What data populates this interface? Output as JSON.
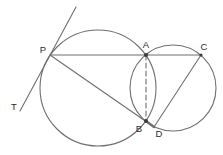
{
  "figure": {
    "width": 223,
    "height": 155,
    "background": "#ffffff",
    "stroke_color": "#6f6f6f",
    "dot_color": "#3c3c3c",
    "label_color": "#2b2b2b",
    "circles": [
      {
        "name": "large-circle",
        "cx": 98,
        "cy": 88,
        "r": 58
      },
      {
        "name": "small-circle",
        "cx": 173,
        "cy": 88,
        "r": 43
      }
    ],
    "lines": [
      {
        "name": "tangent-line-through-P",
        "x1": 76,
        "y1": 7,
        "x2": 20,
        "y2": 111,
        "dashed": false,
        "width": 1.1
      },
      {
        "name": "secant-P-A-C",
        "x1": 50,
        "y1": 55,
        "x2": 201,
        "y2": 55,
        "dashed": false,
        "width": 1.1
      },
      {
        "name": "secant-P-B-D",
        "x1": 50,
        "y1": 55,
        "x2": 154,
        "y2": 127,
        "dashed": false,
        "width": 1.1
      },
      {
        "name": "chord-C-D",
        "x1": 201,
        "y1": 55,
        "x2": 154,
        "y2": 127,
        "dashed": false,
        "width": 1.1
      },
      {
        "name": "segment-B-D-bold",
        "x1": 146,
        "y1": 121,
        "x2": 154,
        "y2": 127,
        "dashed": false,
        "width": 2.3
      },
      {
        "name": "dashed-chord-A-B",
        "x1": 146,
        "y1": 55,
        "x2": 146,
        "y2": 121,
        "dashed": true,
        "width": 1.1
      }
    ],
    "dots": [
      {
        "name": "point-A",
        "x": 146,
        "y": 55,
        "r": 2.0
      },
      {
        "name": "point-B",
        "x": 146,
        "y": 121,
        "r": 2.0
      },
      {
        "name": "point-C",
        "x": 201,
        "y": 55,
        "r": 1.6
      }
    ],
    "labels": [
      {
        "text": "P",
        "x": 43,
        "y": 53
      },
      {
        "text": "A",
        "x": 146,
        "y": 48
      },
      {
        "text": "C",
        "x": 204,
        "y": 50
      },
      {
        "text": "T",
        "x": 14,
        "y": 110
      },
      {
        "text": "B",
        "x": 139,
        "y": 132
      },
      {
        "text": "D",
        "x": 159,
        "y": 137
      }
    ]
  }
}
